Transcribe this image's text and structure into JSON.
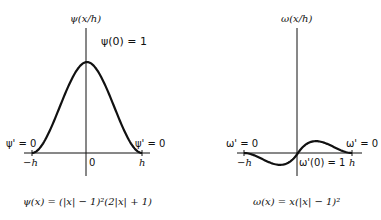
{
  "left_panel": {
    "axis_label": "ψ(x/h)",
    "peak_annotation": "ψ(0) = 1",
    "left_bc": "ψ' = 0",
    "right_bc": "ψ' = 0",
    "tick_neg": "−h",
    "tick_origin": "0",
    "tick_pos": "h",
    "formula": "ψ(x) = (|x| − 1)²(2|x| + 1)"
  },
  "right_panel": {
    "axis_label": "ω(x/h)",
    "left_bc": "ω' = 0",
    "right_bc": "ω' = 0",
    "tick_neg": "−h",
    "origin_annotation": "ω'(0) = 1",
    "tick_pos": "h",
    "formula": "ω(x) = x(|x| − 1)²"
  },
  "colors": {
    "ink": "#111111",
    "background": "#ffffff"
  }
}
